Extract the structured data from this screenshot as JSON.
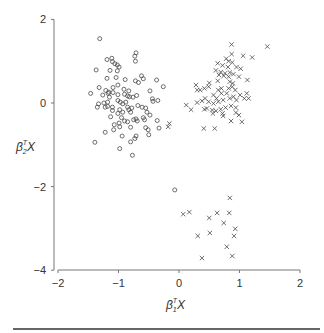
{
  "chart_data": {
    "type": "scatter",
    "title": "",
    "xlabel": "β1ᵀX",
    "ylabel": "β2ᵀX",
    "xlim": [
      -2,
      2
    ],
    "ylim": [
      -4,
      2
    ],
    "xticks": [
      -2,
      -1,
      0,
      1,
      2
    ],
    "yticks": [
      -4,
      -2,
      0,
      2
    ],
    "grid": false,
    "legend": null,
    "series": [
      {
        "name": "class-circle",
        "marker": "circle",
        "points": [
          [
            -1.31,
            1.54
          ],
          [
            -0.71,
            1.2
          ],
          [
            -0.73,
            1.12
          ],
          [
            -0.72,
            1.0
          ],
          [
            -1.19,
            1.04
          ],
          [
            -1.11,
            1.07
          ],
          [
            -1.1,
            0.99
          ],
          [
            -1.06,
            0.94
          ],
          [
            -1.02,
            0.91
          ],
          [
            -0.99,
            0.86
          ],
          [
            -1.14,
            0.78
          ],
          [
            -1.02,
            0.77
          ],
          [
            -1.37,
            0.79
          ],
          [
            -1.19,
            0.59
          ],
          [
            -1.04,
            0.61
          ],
          [
            -0.89,
            0.56
          ],
          [
            -0.72,
            0.53
          ],
          [
            -0.67,
            0.49
          ],
          [
            -0.62,
            0.65
          ],
          [
            -0.59,
            0.58
          ],
          [
            -0.37,
            0.55
          ],
          [
            -0.26,
            0.39
          ],
          [
            -1.32,
            0.37
          ],
          [
            -1.21,
            0.3
          ],
          [
            -1.16,
            0.26
          ],
          [
            -1.09,
            0.37
          ],
          [
            -1.01,
            0.43
          ],
          [
            -0.91,
            0.33
          ],
          [
            -0.83,
            0.29
          ],
          [
            -0.7,
            0.18
          ],
          [
            -0.48,
            0.29
          ],
          [
            -1.46,
            0.23
          ],
          [
            -1.26,
            0.19
          ],
          [
            -1.17,
            0.23
          ],
          [
            -1.09,
            0.25
          ],
          [
            -1.01,
            0.2
          ],
          [
            -0.9,
            0.21
          ],
          [
            -0.85,
            0.17
          ],
          [
            -0.82,
            0.15
          ],
          [
            -0.44,
            0.1
          ],
          [
            -0.43,
            0.04
          ],
          [
            -0.35,
            0.06
          ],
          [
            -1.33,
            -0.02
          ],
          [
            -1.24,
            0.0
          ],
          [
            -1.18,
            0.02
          ],
          [
            -1.01,
            0.06
          ],
          [
            -0.97,
            0.02
          ],
          [
            -0.93,
            -0.02
          ],
          [
            -0.85,
            -0.1
          ],
          [
            -0.83,
            -0.16
          ],
          [
            -0.8,
            -0.22
          ],
          [
            -0.78,
            -0.12
          ],
          [
            -0.68,
            -0.06
          ],
          [
            -0.61,
            -0.1
          ],
          [
            -0.55,
            -0.12
          ],
          [
            -0.53,
            -0.22
          ],
          [
            -1.18,
            -0.08
          ],
          [
            -1.22,
            -0.1
          ],
          [
            -1.1,
            -0.18
          ],
          [
            -0.98,
            -0.16
          ],
          [
            -1.01,
            -0.25
          ],
          [
            -0.95,
            -0.35
          ],
          [
            -0.9,
            -0.43
          ],
          [
            -0.85,
            -0.45
          ],
          [
            -0.75,
            -0.4
          ],
          [
            -0.69,
            -0.43
          ],
          [
            -0.59,
            -0.35
          ],
          [
            -0.57,
            -0.4
          ],
          [
            -0.48,
            -0.29
          ],
          [
            -1.13,
            -0.33
          ],
          [
            -0.99,
            -0.48
          ],
          [
            -0.8,
            -0.58
          ],
          [
            -0.55,
            -0.59
          ],
          [
            -0.51,
            -0.64
          ],
          [
            -0.36,
            -0.42
          ],
          [
            -0.33,
            -0.6
          ],
          [
            -1.07,
            -0.52
          ],
          [
            -1.08,
            -0.64
          ],
          [
            -1.22,
            -0.7
          ],
          [
            -0.98,
            -0.57
          ],
          [
            -0.71,
            -0.79
          ],
          [
            -0.73,
            -0.85
          ],
          [
            -0.5,
            -0.76
          ],
          [
            -0.94,
            -0.79
          ],
          [
            -1.39,
            -0.94
          ],
          [
            -0.8,
            -0.93
          ],
          [
            -0.98,
            -1.09
          ],
          [
            -0.77,
            -1.25
          ],
          [
            -1.35,
            -0.1
          ],
          [
            -1.1,
            -0.1
          ],
          [
            -0.93,
            -0.22
          ],
          [
            -0.71,
            -0.38
          ],
          [
            -0.88,
            0.02
          ],
          [
            -1.15,
            0.14
          ],
          [
            -0.76,
            0.14
          ],
          [
            -0.07,
            -2.08
          ]
        ]
      },
      {
        "name": "class-cross",
        "marker": "x",
        "points": [
          [
            0.87,
            1.4
          ],
          [
            1.46,
            1.35
          ],
          [
            0.87,
            1.17
          ],
          [
            1.06,
            1.13
          ],
          [
            1.21,
            1.09
          ],
          [
            0.78,
            1.06
          ],
          [
            0.82,
            1.0
          ],
          [
            0.64,
            0.95
          ],
          [
            0.88,
            0.97
          ],
          [
            0.72,
            0.9
          ],
          [
            0.81,
            0.86
          ],
          [
            0.95,
            0.86
          ],
          [
            1.02,
            0.82
          ],
          [
            0.61,
            0.78
          ],
          [
            0.69,
            0.74
          ],
          [
            0.76,
            0.71
          ],
          [
            0.84,
            0.73
          ],
          [
            0.9,
            0.69
          ],
          [
            0.66,
            0.67
          ],
          [
            0.74,
            0.65
          ],
          [
            0.82,
            0.63
          ],
          [
            0.99,
            0.63
          ],
          [
            1.13,
            0.55
          ],
          [
            0.5,
            0.48
          ],
          [
            0.64,
            0.53
          ],
          [
            0.84,
            0.51
          ],
          [
            0.89,
            0.47
          ],
          [
            0.28,
            0.43
          ],
          [
            0.3,
            0.31
          ],
          [
            0.35,
            0.31
          ],
          [
            0.42,
            0.35
          ],
          [
            0.49,
            0.39
          ],
          [
            0.65,
            0.31
          ],
          [
            0.7,
            0.35
          ],
          [
            0.82,
            0.35
          ],
          [
            0.88,
            0.39
          ],
          [
            0.93,
            0.31
          ],
          [
            1.01,
            0.19
          ],
          [
            1.12,
            0.23
          ],
          [
            1.15,
            0.11
          ],
          [
            0.7,
            0.23
          ],
          [
            0.79,
            0.23
          ],
          [
            0.57,
            0.19
          ],
          [
            0.62,
            0.11
          ],
          [
            0.43,
            0.11
          ],
          [
            0.38,
            0.05
          ],
          [
            0.3,
            0.01
          ],
          [
            0.12,
            -0.05
          ],
          [
            0.2,
            -0.16
          ],
          [
            0.49,
            0.03
          ],
          [
            0.57,
            -0.01
          ],
          [
            0.65,
            0.03
          ],
          [
            0.73,
            0.07
          ],
          [
            0.84,
            0.11
          ],
          [
            0.9,
            0.15
          ],
          [
            0.95,
            0.07
          ],
          [
            0.46,
            -0.13
          ],
          [
            0.55,
            -0.17
          ],
          [
            0.61,
            -0.19
          ],
          [
            0.69,
            -0.15
          ],
          [
            0.77,
            -0.11
          ],
          [
            0.86,
            -0.07
          ],
          [
            0.94,
            -0.11
          ],
          [
            0.94,
            -0.23
          ],
          [
            0.99,
            -0.29
          ],
          [
            0.73,
            -0.31
          ],
          [
            0.86,
            -0.43
          ],
          [
            1.04,
            -0.45
          ],
          [
            -0.16,
            -0.49
          ],
          [
            -0.18,
            -0.57
          ],
          [
            0.41,
            -0.61
          ],
          [
            0.59,
            -0.61
          ],
          [
            0.56,
            -0.25
          ],
          [
            0.72,
            -0.25
          ],
          [
            0.42,
            -0.15
          ],
          [
            1.08,
            0.11
          ],
          [
            0.84,
            -2.27
          ],
          [
            0.07,
            -2.66
          ],
          [
            0.17,
            -2.61
          ],
          [
            0.5,
            -2.75
          ],
          [
            0.63,
            -2.63
          ],
          [
            0.83,
            -2.63
          ],
          [
            0.74,
            -2.87
          ],
          [
            0.93,
            -3.01
          ],
          [
            0.91,
            -3.18
          ],
          [
            0.31,
            -3.18
          ],
          [
            0.51,
            -3.11
          ],
          [
            0.79,
            -3.44
          ],
          [
            0.88,
            -3.66
          ],
          [
            0.38,
            -3.71
          ]
        ]
      }
    ],
    "plot_area_px": {
      "x0": 54,
      "x_origin": 179,
      "x_unit": 60.5,
      "y_origin": 103,
      "y_unit": 41.8,
      "x_axis_y": 270,
      "y_axis_x": 54
    }
  },
  "labels": {
    "x_axis": {
      "beta": "β",
      "sub": "1",
      "sup": "T",
      "var": "X"
    },
    "y_axis": {
      "beta": "β",
      "sub": "2",
      "sup": "T",
      "var": "X"
    }
  },
  "colors": {
    "marker": "#4a4a4a",
    "axis": "#777777",
    "text": "#333333",
    "rule": "#666666"
  }
}
